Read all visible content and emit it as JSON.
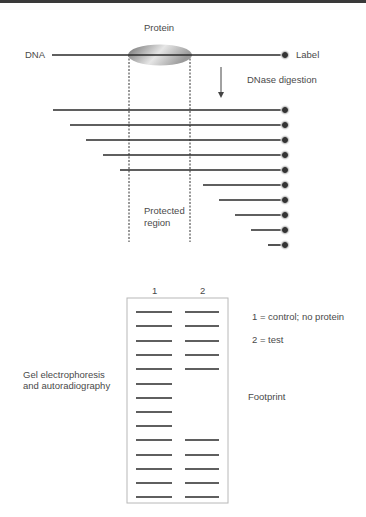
{
  "labels": {
    "protein": "Protein",
    "dna": "DNA",
    "label": "Label",
    "dnase": "DNase digestion",
    "protected_line1": "Protected",
    "protected_line2": "region",
    "lane1": "1",
    "lane2": "2",
    "legend1": "1 = control; no protein",
    "legend2": "2 = test",
    "gel_line1": "Gel electrophoresis",
    "gel_line2": "and autoradiography",
    "footprint": "Footprint"
  },
  "colors": {
    "line": "#2a2a2a",
    "protein_fill_light": "#e8e8e8",
    "protein_fill_dark": "#7a7a7a",
    "gel_border": "#b8b8b8",
    "topbar": "#3a3a3a"
  },
  "dna": {
    "x1": 52,
    "x2": 285,
    "y": 55
  },
  "protein": {
    "cx": 160,
    "cy": 55,
    "rx": 32,
    "ry": 10.5
  },
  "protected_region": {
    "x_left": 129,
    "x_right": 190,
    "y_top": 55,
    "y_bottom": 242
  },
  "fragments": [
    {
      "x_start": 53,
      "y": 110
    },
    {
      "x_start": 70,
      "y": 125
    },
    {
      "x_start": 86,
      "y": 140
    },
    {
      "x_start": 103,
      "y": 155
    },
    {
      "x_start": 120,
      "y": 170
    },
    {
      "x_start": 203,
      "y": 185
    },
    {
      "x_start": 219,
      "y": 200
    },
    {
      "x_start": 235,
      "y": 215
    },
    {
      "x_start": 251,
      "y": 230
    },
    {
      "x_start": 268,
      "y": 245
    }
  ],
  "fragment_end_x": 285,
  "gel": {
    "box": {
      "x": 127,
      "y": 298,
      "w": 101,
      "h": 205
    },
    "lane1_x": [
      136,
      172
    ],
    "lane2_x": [
      185,
      219
    ],
    "band_y": [
      312,
      326,
      341,
      355,
      369,
      384,
      398,
      412,
      426,
      440,
      455,
      469,
      483,
      497
    ],
    "lane1_present": [
      1,
      1,
      1,
      1,
      1,
      1,
      1,
      1,
      1,
      1,
      1,
      1,
      1,
      1
    ],
    "lane2_present": [
      1,
      1,
      1,
      1,
      1,
      0,
      0,
      0,
      0,
      1,
      1,
      1,
      1,
      1
    ]
  }
}
